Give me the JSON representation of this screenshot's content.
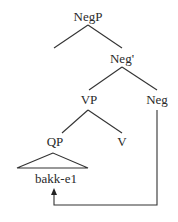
{
  "diagram": {
    "type": "syntax-tree",
    "nodes": {
      "negp": "NegP",
      "negbar": "Neg'",
      "vp": "VP",
      "neg": "Neg",
      "qp": "QP",
      "v": "V",
      "terminal": "bakk-e1"
    },
    "movement_arrow": {
      "from": "Neg",
      "to": "bakk-e1"
    },
    "colors": {
      "line": "#333333",
      "text": "#2a2a2a",
      "background": "#ffffff"
    }
  }
}
